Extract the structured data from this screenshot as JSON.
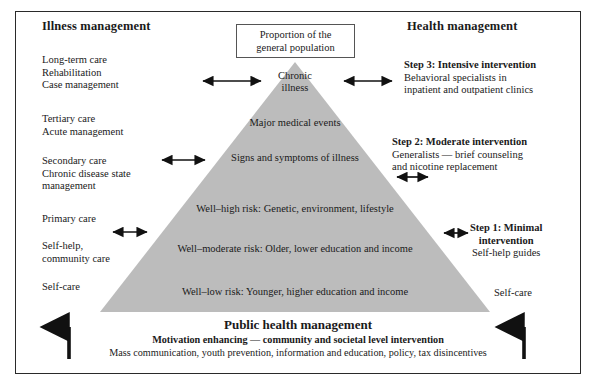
{
  "diagram": {
    "headings": {
      "left": "Illness management",
      "right": "Health management"
    },
    "callout": {
      "line1": "Proportion of the",
      "line2": "general population"
    },
    "left_blocks": [
      {
        "lines": [
          "Long-term care",
          "Rehabilitation",
          "Case management"
        ]
      },
      {
        "lines": [
          "Tertiary care",
          "Acute management"
        ]
      },
      {
        "lines": [
          "Secondary care",
          "Chronic disease state",
          "management"
        ]
      },
      {
        "lines": [
          "Primary care"
        ]
      },
      {
        "lines": [
          "Self-help,",
          "community care"
        ]
      },
      {
        "lines": [
          "Self-care"
        ]
      }
    ],
    "right_blocks": [
      {
        "title": "Step 3:  Intensive intervention",
        "lines": [
          "Behavioral specialists in",
          "inpatient and outpatient clinics"
        ]
      },
      {
        "title": "Step 2: Moderate intervention",
        "lines": [
          "Generalists — brief counseling",
          "and nicotine replacement"
        ]
      },
      {
        "title": "Step 1: Minimal",
        "title2": "intervention",
        "lines": [
          "Self-help guides"
        ]
      },
      {
        "title": "",
        "lines": [
          "Self-care"
        ]
      }
    ],
    "pyramid_bands": [
      {
        "line1": "Chronic",
        "line2": "illness"
      },
      {
        "line1": "Major medical events",
        "line2": ""
      },
      {
        "line1": "Signs and symptoms of illness",
        "line2": ""
      },
      {
        "line1": "Well–high risk: Genetic, environment, lifestyle",
        "line2": ""
      },
      {
        "line1": "Well–moderate risk: Older, lower education and income",
        "line2": ""
      },
      {
        "line1": "Well–low risk: Younger, higher education and income",
        "line2": ""
      }
    ],
    "footer": {
      "title": "Public health management",
      "subtitle": "Motivation enhancing — community and societal level intervention",
      "detail": "Mass communication, youth prevention, information and education, policy, tax disincentives"
    },
    "colors": {
      "pyramid_fill": "#bcbcbc",
      "frame_border": "#2a2a2a",
      "text": "#1a1a1a",
      "arrow": "#111111",
      "callout_border": "#555555"
    },
    "icons": {
      "double_arrow": "double-headed-horizontal-arrow",
      "up_arrow": "upward-arrow"
    }
  }
}
